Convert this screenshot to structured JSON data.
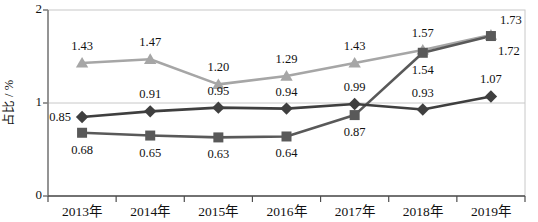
{
  "chart_data": {
    "type": "line",
    "title": "",
    "subtitle": "",
    "xlabel": "",
    "ylabel": "占比 / %",
    "ylim": [
      0,
      2
    ],
    "yticks": [
      0,
      1,
      2
    ],
    "ytick_labels": [
      "0",
      "1",
      "2"
    ],
    "grid": "horizontal-at-1",
    "legend": "none",
    "categories": [
      "2013年",
      "2014年",
      "2015年",
      "2016年",
      "2017年",
      "2018年",
      "2019年"
    ],
    "series": [
      {
        "name": "light-gray-triangle-series",
        "marker": "triangle",
        "color": "#a6a6a6",
        "values": [
          1.43,
          1.47,
          1.2,
          1.29,
          1.43,
          1.57,
          1.73
        ],
        "labels": [
          "1.43",
          "1.47",
          "1.20",
          "1.29",
          "1.43",
          "1.57",
          "1.73"
        ],
        "label_positions": [
          "above",
          "above",
          "above",
          "above",
          "above",
          "above",
          "above-right"
        ]
      },
      {
        "name": "dark-diamond-series",
        "marker": "diamond",
        "color": "#3f3f3f",
        "values": [
          0.85,
          0.91,
          0.95,
          0.94,
          0.99,
          0.93,
          1.07
        ],
        "labels": [
          "0.85",
          "0.91",
          "0.95",
          "0.94",
          "0.99",
          "0.93",
          "1.07"
        ],
        "label_positions": [
          "left",
          "above",
          "above",
          "above",
          "above",
          "above",
          "above"
        ]
      },
      {
        "name": "dark-gray-square-series",
        "marker": "square",
        "color": "#595959",
        "values": [
          0.68,
          0.65,
          0.63,
          0.64,
          0.87,
          1.54,
          1.72
        ],
        "labels": [
          "0.68",
          "0.65",
          "0.63",
          "0.64",
          "0.87",
          "1.54",
          "1.72"
        ],
        "label_positions": [
          "below",
          "below",
          "below",
          "below",
          "below",
          "below",
          "below-right"
        ]
      }
    ]
  },
  "axis": {
    "y_title": "占比 / %",
    "y_tick_top": "2",
    "y_tick_mid": "1",
    "y_tick_bottom": "0"
  },
  "colors": {
    "series_light_gray": "#a6a6a6",
    "series_dark": "#3f3f3f",
    "series_mid_gray": "#595959",
    "axis_line": "#808080",
    "grid_line": "#c8c8c8",
    "plot_border": "#c8c8c8",
    "text": "#111111",
    "background": "#ffffff"
  }
}
